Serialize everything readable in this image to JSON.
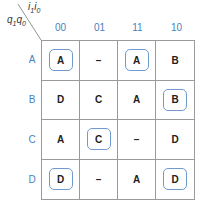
{
  "corner": {
    "top_label": "i",
    "top_sub1": "1",
    "top_sub2": "0",
    "left_label": "q",
    "left_sub1": "1",
    "left_sub2": "0"
  },
  "columns": [
    "00",
    "01",
    "11",
    "10"
  ],
  "rows": [
    {
      "label": "A",
      "cells": [
        {
          "v": "A",
          "c": true
        },
        {
          "v": "–",
          "c": false
        },
        {
          "v": "A",
          "c": true
        },
        {
          "v": "B",
          "c": false
        }
      ]
    },
    {
      "label": "B",
      "cells": [
        {
          "v": "D",
          "c": false
        },
        {
          "v": "C",
          "c": false
        },
        {
          "v": "A",
          "c": false
        },
        {
          "v": "B",
          "c": true
        }
      ]
    },
    {
      "label": "C",
      "cells": [
        {
          "v": "A",
          "c": false
        },
        {
          "v": "C",
          "c": true
        },
        {
          "v": "–",
          "c": false
        },
        {
          "v": "D",
          "c": false
        }
      ]
    },
    {
      "label": "D",
      "cells": [
        {
          "v": "D",
          "c": true
        },
        {
          "v": "–",
          "c": false
        },
        {
          "v": "A",
          "c": false
        },
        {
          "v": "D",
          "c": true
        }
      ]
    }
  ],
  "colors": {
    "header": "#4a7fc1",
    "circle": "#6f9bd1",
    "grid": "#9a9a9a"
  }
}
